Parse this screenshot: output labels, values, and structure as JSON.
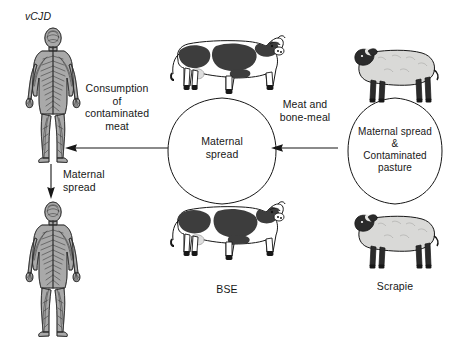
{
  "diagram": {
    "background_color": "#ffffff",
    "ink_color": "#171717"
  },
  "nodes": {
    "human_top": {
      "label": "vCJD",
      "icon": "human-nervous-system-figure",
      "description": "Anatomical human figure showing nervous system"
    },
    "human_bottom": {
      "label": "",
      "icon": "human-nervous-system-figure",
      "description": "Anatomical human figure showing nervous system"
    },
    "cattle": {
      "label": "BSE",
      "icon": "holstein-cow",
      "cycle_label": "Maternal\nspread",
      "top_animal": "holstein-cow-top",
      "bottom_animal": "holstein-cow-bottom"
    },
    "sheep": {
      "label": "Scrapie",
      "icon": "suffolk-sheep",
      "cycle_label": "Maternal spread\n&\nContaminated\npasture",
      "top_animal": "suffolk-sheep-top",
      "bottom_animal": "suffolk-sheep-bottom"
    }
  },
  "arrows": {
    "cattle_to_human": {
      "label": "Consumption\nof\ncontaminated\nmeat",
      "direction": "left"
    },
    "sheep_to_cattle": {
      "label": "Meat and\nbone-meal",
      "direction": "left"
    },
    "human_maternal": {
      "label": "Maternal\nspread",
      "direction": "down"
    }
  },
  "colors": {
    "ink": "#171717",
    "cow_patch": "#3d3d3d",
    "cow_body": "#ffffff",
    "sheep_fleece": "#d9d9d7",
    "sheep_face": "#2b2b2b",
    "human_tone": "#8e8e8e"
  }
}
